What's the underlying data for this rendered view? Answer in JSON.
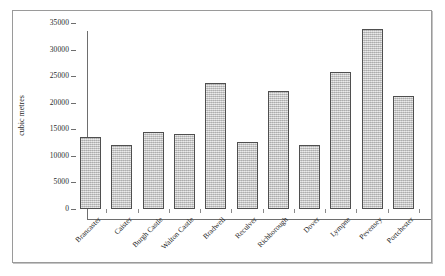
{
  "chart_data": {
    "type": "bar",
    "title": "",
    "xlabel": "",
    "ylabel": "cubic metres",
    "ylim": [
      0,
      35000
    ],
    "ytick_step": 5000,
    "yticks": [
      "35000",
      "30000",
      "25000",
      "20000",
      "15000",
      "10000",
      "5000",
      "0"
    ],
    "grid": false,
    "legend": null,
    "categories": [
      "Brancaster",
      "Caister",
      "Burgh Castle",
      "Walton Castle",
      "Bradwell",
      "Reculver",
      "Richborough",
      "Dover",
      "Lympne",
      "Pevensey",
      "Portchester"
    ],
    "values": [
      13500,
      12000,
      14400,
      14100,
      23800,
      12600,
      22200,
      12100,
      25700,
      33900,
      21300
    ]
  },
  "style": {
    "bar_fill": "#c9c9c9",
    "bar_border": "#4f4f4f",
    "axis_color": "#6e6e6e",
    "frame_color": "#9a9a9a",
    "background": "#ffffff",
    "text_color": "#1f1f1f"
  }
}
